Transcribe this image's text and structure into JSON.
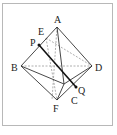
{
  "figure": {
    "type": "octahedron",
    "labels": {
      "A": "A",
      "B": "B",
      "C": "C",
      "D": "D",
      "E": "E",
      "F": "F",
      "P": "P",
      "Q": "Q"
    },
    "vertices": {
      "A": [
        57,
        27
      ],
      "B": [
        21,
        66
      ],
      "C": [
        64,
        84
      ],
      "D": [
        92,
        66
      ],
      "E": [
        46,
        38
      ],
      "F": [
        57,
        100
      ]
    },
    "points": {
      "P": [
        39,
        45
      ],
      "Q": [
        76,
        87
      ]
    },
    "colors": {
      "line": "#333333",
      "hidden": "#999999",
      "segment": "#111111",
      "border": "#b8b8b8"
    }
  }
}
